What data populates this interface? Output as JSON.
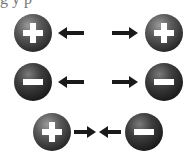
{
  "caption_partial": "g   y p",
  "rows": [
    {
      "left_charge": "positive",
      "right_charge": "positive",
      "relation": "repel"
    },
    {
      "left_charge": "negative",
      "right_charge": "negative",
      "relation": "repel"
    },
    {
      "left_charge": "positive",
      "right_charge": "negative",
      "relation": "attract"
    }
  ],
  "colors": {
    "sphere": "#3a3a3a",
    "arrow": "#1a1a1a",
    "sign": "#ffffff"
  }
}
